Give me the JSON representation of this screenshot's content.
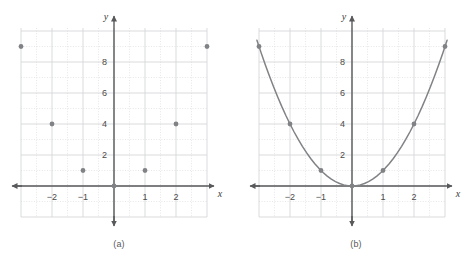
{
  "figure": {
    "panels": [
      {
        "caption": "(a)",
        "type": "scatter",
        "x_axis_label": "x",
        "y_axis_label": "y"
      },
      {
        "caption": "(b)",
        "type": "line",
        "x_axis_label": "x",
        "y_axis_label": "y"
      }
    ]
  },
  "chart_data": [
    {
      "type": "scatter",
      "title": "",
      "subtitle": "",
      "caption": "(a)",
      "xlabel": "x",
      "ylabel": "y",
      "x": [
        -3,
        -2,
        -1,
        0,
        1,
        2,
        3
      ],
      "values": [
        9,
        4,
        1,
        0,
        1,
        4,
        9
      ],
      "series": [
        {
          "name": "y = x^2 points",
          "points": [
            {
              "x": -3,
              "y": 9
            },
            {
              "x": -2,
              "y": 4
            },
            {
              "x": -1,
              "y": 1
            },
            {
              "x": 0,
              "y": 0
            },
            {
              "x": 1,
              "y": 1
            },
            {
              "x": 2,
              "y": 4
            },
            {
              "x": 3,
              "y": 9
            }
          ]
        }
      ],
      "xlim": [
        -3.2,
        3.2
      ],
      "ylim": [
        -2,
        10.2
      ],
      "xticks": [
        -2,
        -1,
        1,
        2
      ],
      "xtick_labels": [
        "−2",
        "−1",
        "1",
        "2"
      ],
      "yticks": [
        2,
        4,
        6,
        8
      ],
      "ytick_labels": [
        "2",
        "4",
        "6",
        "8"
      ],
      "grid": true,
      "grid_major_x_step": 1,
      "grid_minor_x_step": 0.5,
      "grid_major_y_step": 2,
      "grid_minor_y_step": 1,
      "legend": "none",
      "marker_color": "#808285",
      "grid_color": "#d9dadb",
      "axis_color": "#58595b"
    },
    {
      "type": "line",
      "title": "",
      "subtitle": "",
      "caption": "(b)",
      "xlabel": "x",
      "ylabel": "y",
      "x": [
        -3,
        -2,
        -1,
        0,
        1,
        2,
        3
      ],
      "values": [
        9,
        4,
        1,
        0,
        1,
        4,
        9
      ],
      "series": [
        {
          "name": "y = x^2 curve",
          "points": [
            {
              "x": -3,
              "y": 9
            },
            {
              "x": -2,
              "y": 4
            },
            {
              "x": -1,
              "y": 1
            },
            {
              "x": 0,
              "y": 0
            },
            {
              "x": 1,
              "y": 1
            },
            {
              "x": 2,
              "y": 4
            },
            {
              "x": 3,
              "y": 9
            }
          ]
        }
      ],
      "xlim": [
        -3.2,
        3.2
      ],
      "ylim": [
        -2,
        10.2
      ],
      "xticks": [
        -2,
        -1,
        1,
        2
      ],
      "xtick_labels": [
        "−2",
        "−1",
        "1",
        "2"
      ],
      "yticks": [
        2,
        4,
        6,
        8
      ],
      "ytick_labels": [
        "2",
        "4",
        "6",
        "8"
      ],
      "grid": true,
      "grid_major_x_step": 1,
      "grid_minor_x_step": 0.5,
      "grid_major_y_step": 2,
      "grid_minor_y_step": 1,
      "legend": "none",
      "curve_color": "#808285",
      "marker_color": "#808285",
      "grid_color": "#d9dadb",
      "axis_color": "#58595b"
    }
  ]
}
